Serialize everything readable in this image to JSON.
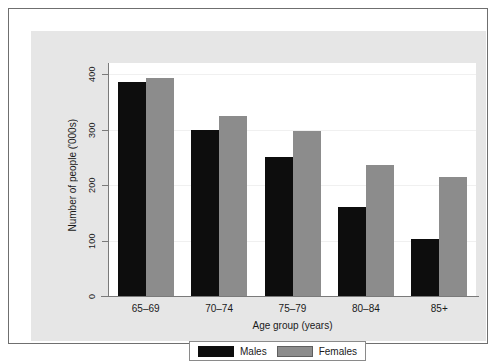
{
  "chart_data": {
    "type": "bar",
    "title": "",
    "xlabel": "Age group (years)",
    "ylabel": "Number of people ('000s)",
    "categories": [
      "65–69",
      "70–74",
      "75–79",
      "80–84",
      "85+"
    ],
    "series": [
      {
        "name": "Males",
        "color": "#0d0d0d",
        "values": [
          386,
          300,
          250,
          160,
          102
        ]
      },
      {
        "name": "Females",
        "color": "#8c8c8c",
        "values": [
          393,
          325,
          298,
          237,
          215
        ]
      }
    ],
    "ylim": [
      0,
      420
    ],
    "yticks": [
      0,
      100,
      200,
      300,
      400
    ],
    "ytick_labels": [
      "0",
      "100",
      "200",
      "300",
      "400"
    ],
    "grid": true,
    "legend_position": "bottom"
  },
  "legend": {
    "entries": [
      {
        "label": "Males"
      },
      {
        "label": "Females"
      }
    ]
  }
}
